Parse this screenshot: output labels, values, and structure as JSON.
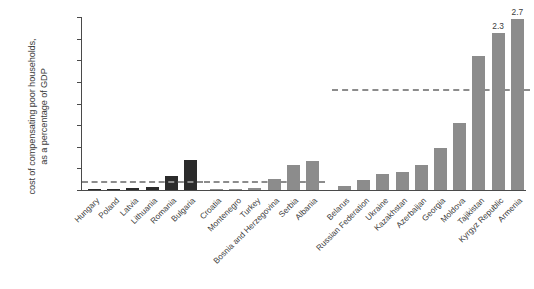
{
  "chart_data": {
    "type": "bar",
    "title": "",
    "xlabel": "",
    "ylabel": "cost of compensating poor households,\nas a percentage of GDP",
    "ylim": [
      0,
      1.6
    ],
    "ytick_labels": [
      "1.6",
      "1.4",
      "1.2",
      "1.0",
      "0.8",
      "0.6",
      "0.4",
      "0.2",
      "0"
    ],
    "ytick_values": [
      1.6,
      1.4,
      1.2,
      1.0,
      0.8,
      0.6,
      0.4,
      0.2,
      0
    ],
    "grid": false,
    "legend": "none",
    "groups": [
      {
        "name": "group-1",
        "color": "#2b2b2b",
        "reference_line": 0.08,
        "categories": [
          "Hungary",
          "Poland",
          "Latvia",
          "Lithuania",
          "Romania",
          "Bulgaria"
        ],
        "values": [
          0.01,
          0.01,
          0.015,
          0.025,
          0.13,
          0.28
        ]
      },
      {
        "name": "group-2",
        "color": "#8c8c8c",
        "reference_line": 0.08,
        "categories": [
          "Croatia",
          "Montenegro",
          "Turkey",
          "Bosnia and Herzegovina",
          "Serbia",
          "Albania"
        ],
        "values": [
          0.005,
          0.005,
          0.02,
          0.1,
          0.23,
          0.27
        ]
      },
      {
        "name": "group-3",
        "color": "#8c8c8c",
        "reference_line": 0.93,
        "categories": [
          "Belarus",
          "Russian Federation",
          "Ukraine",
          "Kazakhstan",
          "Azerbaijan",
          "Georgia",
          "Moldova",
          "Tajikistan",
          "Kyrgyz Republic",
          "Armenia"
        ],
        "values": [
          0.04,
          0.09,
          0.15,
          0.17,
          0.23,
          0.39,
          0.62,
          1.24,
          1.45,
          1.58
        ],
        "clipped_labels": {
          "8": "2.3",
          "9": "2.7"
        },
        "true_values": {
          "8": 2.3,
          "9": 2.7
        }
      }
    ],
    "annotations": [
      "2.3",
      "2.7"
    ],
    "colors": {
      "bar_dark": "#2b2b2b",
      "bar_gray": "#8c8c8c",
      "axis": "#4a4a4a",
      "text": "#3c3c3c",
      "background": "#ffffff"
    }
  }
}
